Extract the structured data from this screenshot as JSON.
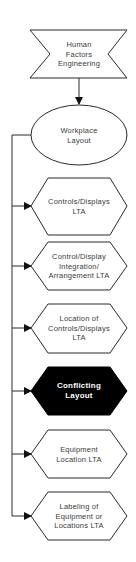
{
  "diagram": {
    "top_event": {
      "shape": "transfer-in",
      "lines": [
        "Human",
        "Factors",
        "Engineering"
      ]
    },
    "parent": {
      "shape": "ellipse",
      "lines": [
        "Workplace",
        "Layout"
      ]
    },
    "children": [
      {
        "shape": "hexagon",
        "highlighted": false,
        "lines": [
          "Controls/Displays",
          "LTA"
        ]
      },
      {
        "shape": "hexagon",
        "highlighted": false,
        "lines": [
          "Control/Display",
          "Integration/",
          "Arrangement  LTA"
        ]
      },
      {
        "shape": "hexagon",
        "highlighted": false,
        "lines": [
          "Location of",
          "Controls/Displays",
          "LTA"
        ]
      },
      {
        "shape": "hexagon",
        "highlighted": true,
        "lines": [
          "Conflicting",
          "Layout"
        ]
      },
      {
        "shape": "hexagon",
        "highlighted": false,
        "lines": [
          "Equipment",
          "Location  LTA"
        ]
      },
      {
        "shape": "hexagon",
        "highlighted": false,
        "lines": [
          "Labeling of",
          "Equipment or",
          "Locations  LTA"
        ]
      }
    ],
    "colors": {
      "stroke": "#2a2a2a",
      "fill": "#ffffff",
      "highlight_fill": "#000000",
      "highlight_text": "#ffffff",
      "text": "#3a3a3a"
    }
  }
}
